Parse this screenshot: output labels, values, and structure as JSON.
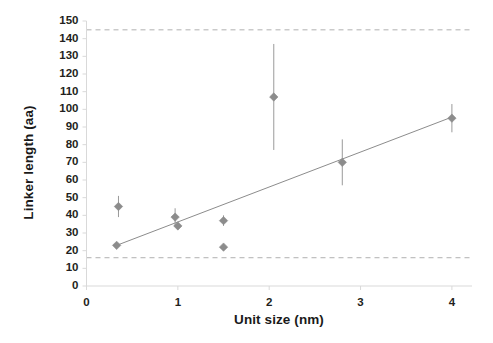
{
  "chart_data": {
    "type": "scatter",
    "title": "",
    "xlabel": "Unit size (nm)",
    "ylabel": "Linker length (aa)",
    "xlim": [
      0,
      4.22
    ],
    "ylim": [
      0,
      150
    ],
    "xticks": [
      "0",
      "1",
      "2",
      "3",
      "4"
    ],
    "xtick_values": [
      0,
      1,
      2,
      3,
      4
    ],
    "yticks": [
      "0",
      "10",
      "20",
      "30",
      "40",
      "50",
      "60",
      "70",
      "80",
      "90",
      "100",
      "110",
      "120",
      "130",
      "140",
      "150"
    ],
    "ytick_values": [
      0,
      10,
      20,
      30,
      40,
      50,
      60,
      70,
      80,
      90,
      100,
      110,
      120,
      130,
      140,
      150
    ],
    "grid": false,
    "legend": "none",
    "marker": "diamond",
    "marker_color": "#8c8c8c",
    "errorbar_color": "#9a9a9a",
    "trendline_color": "#8c8c8c",
    "reference_line_color": "#b0b0b0",
    "axis_color": "#d9d9d9",
    "points": [
      {
        "x": 0.35,
        "y": 45,
        "yerr": 6,
        "has_error": true
      },
      {
        "x": 0.33,
        "y": 23,
        "yerr": 0,
        "has_error": false
      },
      {
        "x": 0.97,
        "y": 39,
        "yerr": 5,
        "has_error": true
      },
      {
        "x": 1.0,
        "y": 34,
        "yerr": 0,
        "has_error": false
      },
      {
        "x": 1.5,
        "y": 37,
        "yerr": 3,
        "has_error": true
      },
      {
        "x": 1.5,
        "y": 22,
        "yerr": 0,
        "has_error": false
      },
      {
        "x": 2.05,
        "y": 107,
        "yerr": 30,
        "has_error": true
      },
      {
        "x": 2.8,
        "y": 70,
        "yerr": 13,
        "has_error": true
      },
      {
        "x": 4.0,
        "y": 95,
        "yerr": 8,
        "has_error": true
      }
    ],
    "trendline": {
      "x0": 0.33,
      "y0": 23,
      "x1": 4.02,
      "y1": 96
    },
    "reference_lines": [
      {
        "y": 145,
        "style": "dashed"
      },
      {
        "y": 16,
        "style": "dashed"
      }
    ]
  }
}
